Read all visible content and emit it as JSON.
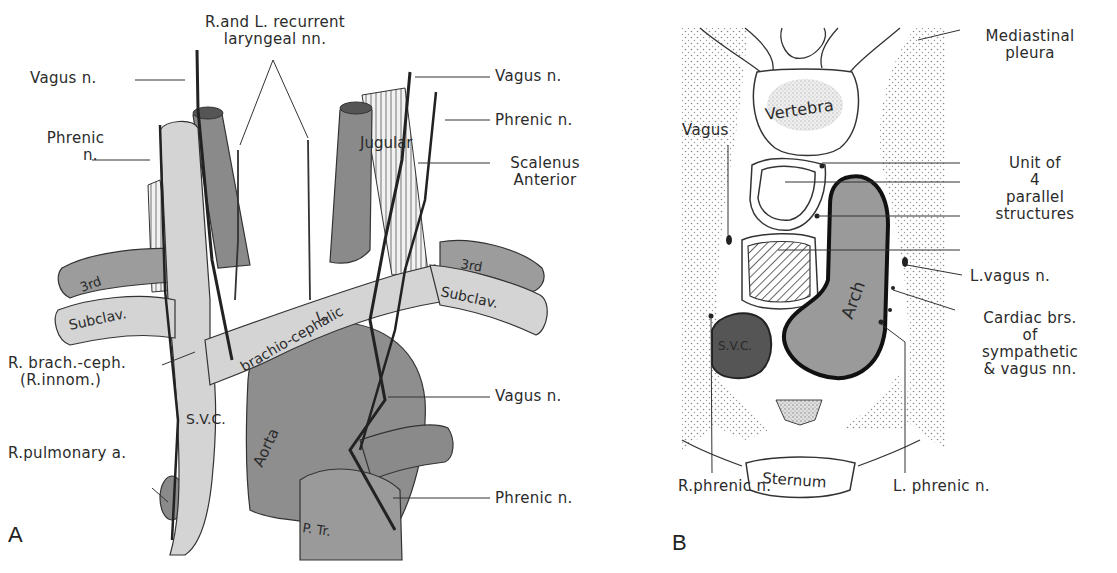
{
  "figure": {
    "panel_a": {
      "letter": "A",
      "labels": {
        "recurrent_laryngeal_line1": "R.and L. recurrent",
        "recurrent_laryngeal_line2": "laryngeal nn.",
        "vagus_left": "Vagus n.",
        "phrenic_left_line1": "Phrenic",
        "phrenic_left_line2": "n.",
        "vagus_right": "Vagus n.",
        "phrenic_right": "Phrenic n.",
        "scalenus_line1": "Scalenus",
        "scalenus_line2": "Anterior",
        "r_brachceph_line1": "R. brach.-ceph.",
        "r_brachceph_line2": "(R.innom.)",
        "r_pulmonary": "R.pulmonary a.",
        "vagus_lower": "Vagus n.",
        "phrenic_lower": "Phrenic n."
      },
      "in_figure": {
        "jugular": "Jugular",
        "third_left": "3rd",
        "third_right": "3rd",
        "subclav_left": "Subclav.",
        "subclav_right": "Subclav.",
        "l_letter": "L.",
        "brachio_cephalic": "brachio-cephalic",
        "svc": "S.V.C.",
        "aorta": "Aorta",
        "ptr": "P. Tr."
      }
    },
    "panel_b": {
      "letter": "B",
      "labels": {
        "mediastinal_line1": "Mediastinal",
        "mediastinal_line2": "pleura",
        "vagus": "Vagus",
        "unit_line1": "Unit of",
        "unit_line2": "4",
        "unit_line3": "parallel",
        "unit_line4": "structures",
        "l_vagus": "L.vagus n.",
        "cardiac_line1": "Cardiac brs.",
        "cardiac_line2": "of",
        "cardiac_line3": "sympathetic",
        "cardiac_line4": "& vagus nn.",
        "r_phrenic": "R.phrenic n.",
        "l_phrenic": "L. phrenic n."
      },
      "in_figure": {
        "vertebra": "Vertebra",
        "arch": "Arch",
        "svc": "S.V.C.",
        "sternum": "Sternum"
      }
    },
    "colors": {
      "vein_fill": "#d4d4d4",
      "artery_fill": "#8a8a8a",
      "dark_fill": "#5a5a5a",
      "line": "#2a2a2a",
      "stipple": "#bdbdbd"
    }
  }
}
